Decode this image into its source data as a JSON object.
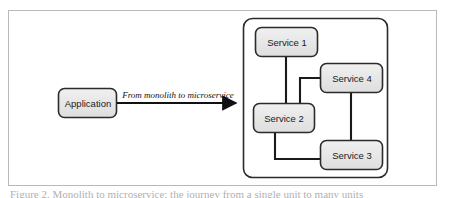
{
  "figure": {
    "caption": "Figure 2. Monolith to microservice: the journey from a single unit to many units",
    "frame_color": "#b9b9b9",
    "background": "#ffffff"
  },
  "diagram": {
    "type": "architecture-diagram",
    "node_fill": "#e8e8e8",
    "node_stroke": "#2b2b2b",
    "edge_stroke": "#1a1a1a",
    "source": {
      "id": "application",
      "label": "Application",
      "x": 58,
      "y": 88,
      "width": 59,
      "height": 30
    },
    "transition": {
      "id": "monolith-to-microservice-arrow",
      "label": "From monolith to microservice",
      "from": "application",
      "to": "microservices-container",
      "x1": 117,
      "x2": 243,
      "y": 103
    },
    "container": {
      "id": "microservices-container",
      "label": "",
      "x": 243,
      "y": 18,
      "width": 145,
      "height": 160
    },
    "services": [
      {
        "id": "service-1",
        "label": "Service 1",
        "x": 255,
        "y": 27,
        "width": 63,
        "height": 30
      },
      {
        "id": "service-2",
        "label": "Service 2",
        "x": 253,
        "y": 103,
        "width": 62,
        "height": 30
      },
      {
        "id": "service-3",
        "label": "Service 3",
        "x": 320,
        "y": 140,
        "width": 63,
        "height": 30
      },
      {
        "id": "service-4",
        "label": "Service 4",
        "x": 320,
        "y": 63,
        "width": 63,
        "height": 30
      }
    ],
    "connections": [
      {
        "id": "conn-s1-s2",
        "from": "service-1",
        "to": "service-2",
        "style": "straight-vertical"
      },
      {
        "id": "conn-s2-s4",
        "from": "service-2",
        "to": "service-4",
        "style": "elbow"
      },
      {
        "id": "conn-s4-s3",
        "from": "service-4",
        "to": "service-3",
        "style": "straight-vertical"
      },
      {
        "id": "conn-s2-s3",
        "from": "service-2",
        "to": "service-3",
        "style": "elbow"
      }
    ]
  }
}
